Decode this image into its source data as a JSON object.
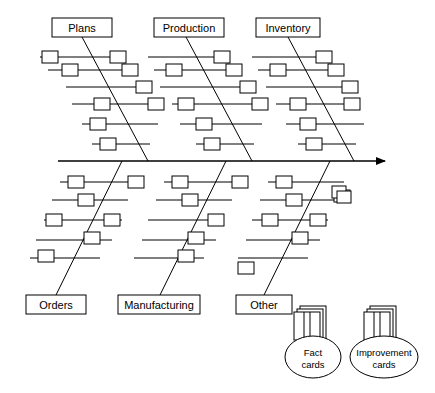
{
  "diagram": {
    "type": "fishbone-cause-and-effect",
    "spine": {
      "x1": 58,
      "y1": 161,
      "x2": 385,
      "y2": 161,
      "arrow": "right"
    },
    "categories_top": [
      {
        "id": "plans",
        "label": "Plans",
        "label_box": {
          "x": 52,
          "y": 18,
          "w": 60,
          "h": 19
        },
        "bone": {
          "x1": 82,
          "y1": 37,
          "x2": 148,
          "y2": 161
        },
        "twigs": [
          {
            "x1": 40,
            "y1": 57,
            "x2": 114,
            "y2": 57
          },
          {
            "x1": 48,
            "y1": 70,
            "x2": 126,
            "y2": 70
          },
          {
            "x1": 66,
            "y1": 87,
            "x2": 140,
            "y2": 87
          },
          {
            "x1": 72,
            "y1": 104,
            "x2": 152,
            "y2": 104
          },
          {
            "x1": 82,
            "y1": 124,
            "x2": 158,
            "y2": 124
          },
          {
            "x1": 92,
            "y1": 144,
            "x2": 150,
            "y2": 144
          }
        ],
        "nodes": [
          {
            "x": 42,
            "y": 51,
            "w": 16,
            "h": 12
          },
          {
            "x": 110,
            "y": 51,
            "w": 16,
            "h": 12
          },
          {
            "x": 62,
            "y": 64,
            "w": 16,
            "h": 12
          },
          {
            "x": 122,
            "y": 64,
            "w": 16,
            "h": 12
          },
          {
            "x": 136,
            "y": 81,
            "w": 16,
            "h": 12
          },
          {
            "x": 94,
            "y": 98,
            "w": 16,
            "h": 12
          },
          {
            "x": 148,
            "y": 98,
            "w": 16,
            "h": 12
          },
          {
            "x": 90,
            "y": 118,
            "w": 16,
            "h": 12
          },
          {
            "x": 100,
            "y": 138,
            "w": 16,
            "h": 12
          }
        ]
      },
      {
        "id": "production",
        "label": "Production",
        "label_box": {
          "x": 154,
          "y": 18,
          "w": 70,
          "h": 19
        },
        "bone": {
          "x1": 186,
          "y1": 37,
          "x2": 252,
          "y2": 161
        },
        "twigs": [
          {
            "x1": 148,
            "y1": 57,
            "x2": 218,
            "y2": 57
          },
          {
            "x1": 154,
            "y1": 70,
            "x2": 230,
            "y2": 70
          },
          {
            "x1": 160,
            "y1": 87,
            "x2": 244,
            "y2": 87
          },
          {
            "x1": 172,
            "y1": 104,
            "x2": 256,
            "y2": 104
          },
          {
            "x1": 180,
            "y1": 124,
            "x2": 262,
            "y2": 124
          },
          {
            "x1": 196,
            "y1": 144,
            "x2": 254,
            "y2": 144
          }
        ],
        "nodes": [
          {
            "x": 214,
            "y": 51,
            "w": 16,
            "h": 12
          },
          {
            "x": 166,
            "y": 64,
            "w": 16,
            "h": 12
          },
          {
            "x": 226,
            "y": 64,
            "w": 16,
            "h": 12
          },
          {
            "x": 240,
            "y": 81,
            "w": 16,
            "h": 12
          },
          {
            "x": 178,
            "y": 98,
            "w": 16,
            "h": 12
          },
          {
            "x": 252,
            "y": 98,
            "w": 16,
            "h": 12
          },
          {
            "x": 196,
            "y": 118,
            "w": 16,
            "h": 12
          },
          {
            "x": 204,
            "y": 138,
            "w": 16,
            "h": 12
          }
        ]
      },
      {
        "id": "inventory",
        "label": "Inventory",
        "label_box": {
          "x": 256,
          "y": 18,
          "w": 64,
          "h": 19
        },
        "bone": {
          "x1": 288,
          "y1": 37,
          "x2": 354,
          "y2": 161
        },
        "twigs": [
          {
            "x1": 252,
            "y1": 57,
            "x2": 320,
            "y2": 57
          },
          {
            "x1": 258,
            "y1": 70,
            "x2": 332,
            "y2": 70
          },
          {
            "x1": 266,
            "y1": 87,
            "x2": 346,
            "y2": 87
          },
          {
            "x1": 276,
            "y1": 104,
            "x2": 358,
            "y2": 104
          },
          {
            "x1": 286,
            "y1": 124,
            "x2": 364,
            "y2": 124
          },
          {
            "x1": 298,
            "y1": 144,
            "x2": 356,
            "y2": 144
          }
        ],
        "nodes": [
          {
            "x": 316,
            "y": 51,
            "w": 16,
            "h": 12
          },
          {
            "x": 270,
            "y": 64,
            "w": 16,
            "h": 12
          },
          {
            "x": 328,
            "y": 64,
            "w": 16,
            "h": 12
          },
          {
            "x": 342,
            "y": 81,
            "w": 16,
            "h": 12
          },
          {
            "x": 290,
            "y": 98,
            "w": 16,
            "h": 12
          },
          {
            "x": 344,
            "y": 98,
            "w": 16,
            "h": 12
          },
          {
            "x": 300,
            "y": 118,
            "w": 16,
            "h": 12
          },
          {
            "x": 306,
            "y": 138,
            "w": 16,
            "h": 12
          }
        ]
      }
    ],
    "categories_bottom": [
      {
        "id": "orders",
        "label": "Orders",
        "label_box": {
          "x": 26,
          "y": 295,
          "w": 60,
          "h": 19
        },
        "bone": {
          "x1": 122,
          "y1": 161,
          "x2": 56,
          "y2": 295
        },
        "twigs": [
          {
            "x1": 60,
            "y1": 182,
            "x2": 136,
            "y2": 182
          },
          {
            "x1": 52,
            "y1": 200,
            "x2": 128,
            "y2": 200
          },
          {
            "x1": 44,
            "y1": 220,
            "x2": 122,
            "y2": 220
          },
          {
            "x1": 36,
            "y1": 240,
            "x2": 112,
            "y2": 240
          },
          {
            "x1": 30,
            "y1": 258,
            "x2": 100,
            "y2": 258
          }
        ],
        "nodes": [
          {
            "x": 68,
            "y": 176,
            "w": 16,
            "h": 12
          },
          {
            "x": 128,
            "y": 176,
            "w": 16,
            "h": 12
          },
          {
            "x": 78,
            "y": 194,
            "w": 16,
            "h": 12
          },
          {
            "x": 46,
            "y": 214,
            "w": 16,
            "h": 12
          },
          {
            "x": 104,
            "y": 214,
            "w": 16,
            "h": 12
          },
          {
            "x": 84,
            "y": 232,
            "w": 16,
            "h": 12
          },
          {
            "x": 38,
            "y": 250,
            "w": 16,
            "h": 12
          }
        ]
      },
      {
        "id": "manufacturing",
        "label": "Manufacturing",
        "label_box": {
          "x": 118,
          "y": 295,
          "w": 82,
          "h": 19
        },
        "bone": {
          "x1": 226,
          "y1": 161,
          "x2": 160,
          "y2": 295
        },
        "twigs": [
          {
            "x1": 164,
            "y1": 182,
            "x2": 240,
            "y2": 182
          },
          {
            "x1": 156,
            "y1": 200,
            "x2": 232,
            "y2": 200
          },
          {
            "x1": 148,
            "y1": 220,
            "x2": 224,
            "y2": 220
          },
          {
            "x1": 142,
            "y1": 240,
            "x2": 216,
            "y2": 240
          },
          {
            "x1": 134,
            "y1": 258,
            "x2": 204,
            "y2": 258
          }
        ],
        "nodes": [
          {
            "x": 172,
            "y": 176,
            "w": 16,
            "h": 12
          },
          {
            "x": 232,
            "y": 176,
            "w": 16,
            "h": 12
          },
          {
            "x": 182,
            "y": 194,
            "w": 16,
            "h": 12
          },
          {
            "x": 208,
            "y": 214,
            "w": 16,
            "h": 12
          },
          {
            "x": 188,
            "y": 232,
            "w": 16,
            "h": 12
          },
          {
            "x": 178,
            "y": 250,
            "w": 16,
            "h": 12
          }
        ]
      },
      {
        "id": "other",
        "label": "Other",
        "label_box": {
          "x": 236,
          "y": 295,
          "w": 56,
          "h": 19
        },
        "bone": {
          "x1": 330,
          "y1": 161,
          "x2": 264,
          "y2": 295
        },
        "twigs": [
          {
            "x1": 268,
            "y1": 182,
            "x2": 344,
            "y2": 182
          },
          {
            "x1": 260,
            "y1": 200,
            "x2": 336,
            "y2": 200
          },
          {
            "x1": 252,
            "y1": 220,
            "x2": 328,
            "y2": 220
          },
          {
            "x1": 246,
            "y1": 240,
            "x2": 320,
            "y2": 240
          },
          {
            "x1": 238,
            "y1": 258,
            "x2": 308,
            "y2": 258
          }
        ],
        "nodes": [
          {
            "x": 276,
            "y": 176,
            "w": 16,
            "h": 12
          },
          {
            "x": 334,
            "y": 190,
            "w": 16,
            "h": 12
          },
          {
            "x": 286,
            "y": 194,
            "w": 16,
            "h": 12
          },
          {
            "x": 262,
            "y": 214,
            "w": 16,
            "h": 12
          },
          {
            "x": 310,
            "y": 214,
            "w": 16,
            "h": 12
          },
          {
            "x": 292,
            "y": 232,
            "w": 16,
            "h": 12
          },
          {
            "x": 238,
            "y": 262,
            "w": 16,
            "h": 12
          }
        ]
      }
    ],
    "floating_nodes": [
      {
        "x": 332,
        "y": 186,
        "w": 14,
        "h": 12
      },
      {
        "x": 337,
        "y": 191,
        "w": 14,
        "h": 12
      }
    ],
    "legend": [
      {
        "id": "fact-cards",
        "label_line1": "Fact",
        "label_line2": "cards",
        "stack": {
          "x": 294,
          "y": 306,
          "w": 32,
          "h": 34
        },
        "oval": {
          "cx": 313,
          "cy": 357,
          "rx": 28,
          "ry": 21
        }
      },
      {
        "id": "improvement-cards",
        "label_line1": "Improvement",
        "label_line2": "cards",
        "stack": {
          "x": 364,
          "y": 306,
          "w": 32,
          "h": 34
        },
        "oval": {
          "cx": 384,
          "cy": 357,
          "rx": 34,
          "ry": 21
        }
      }
    ]
  }
}
